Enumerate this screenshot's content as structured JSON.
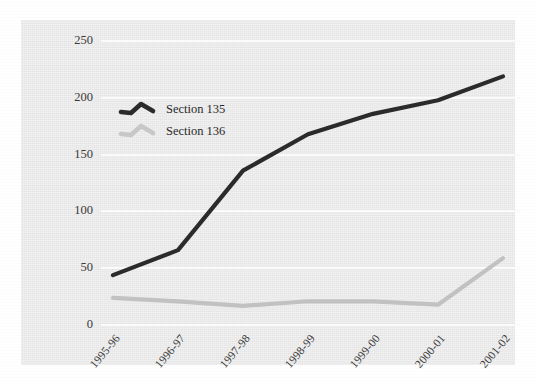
{
  "chart_data": {
    "type": "line",
    "title": "",
    "subtitle": "",
    "xlabel": "",
    "ylabel": "",
    "categories": [
      "1995-96",
      "1996-97",
      "1997-98",
      "1998-99",
      "1999-00",
      "2000-01",
      "2001-02"
    ],
    "series": [
      {
        "name": "Section 135",
        "color": "#2b2b2b",
        "values": [
          43,
          65,
          135,
          167,
          185,
          197,
          218
        ]
      },
      {
        "name": "Section 136",
        "color": "#c2c2c2",
        "values": [
          23,
          20,
          16,
          20,
          20,
          17,
          58
        ]
      }
    ],
    "ylim": [
      0,
      250
    ],
    "yticks": [
      0,
      50,
      100,
      150,
      200,
      250
    ],
    "ytick_labels": [
      "0",
      "50",
      "100",
      "150",
      "200",
      "250"
    ],
    "grid": "horizontal",
    "legend_position": "upper-left-inside",
    "plot_background": "#e7e7e7",
    "gridline_color": "#fbfbfb",
    "page_background": "#ffffff"
  },
  "legend": {
    "items": [
      {
        "label": "Section 135"
      },
      {
        "label": "Section 136"
      }
    ]
  },
  "axes": {
    "y": {
      "labels": [
        "250",
        "200",
        "150",
        "100",
        "50",
        "0"
      ]
    },
    "x": {
      "labels": [
        "1995-96",
        "1996-97",
        "1997-98",
        "1998-99",
        "1999-00",
        "2000-01",
        "2001-02"
      ]
    }
  }
}
